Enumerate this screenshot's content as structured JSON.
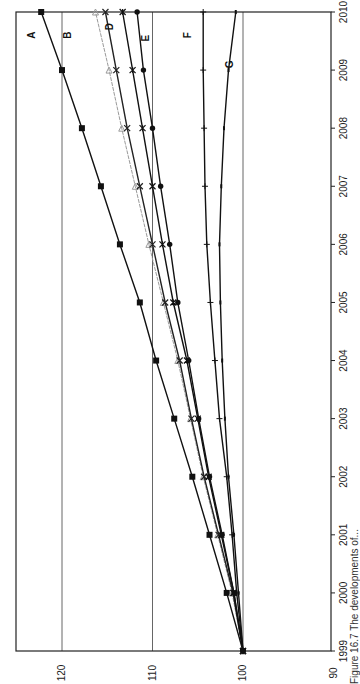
{
  "chart_data": {
    "type": "line",
    "orientation": "rotated-90-ccw",
    "title": "",
    "xlabel": "",
    "ylabel": "",
    "x": [
      "1999",
      "2000",
      "2001",
      "2002",
      "2003",
      "2004",
      "2005",
      "2006",
      "2007",
      "2008",
      "2009",
      "2010"
    ],
    "ylim": [
      90,
      125
    ],
    "yticks": [
      90,
      100,
      110,
      120
    ],
    "ytick_labels": [
      "90",
      "100",
      "110",
      "120"
    ],
    "grid": "horizontal gridlines at 100, 110, 120",
    "legend": "inline labels at line ends",
    "series": [
      {
        "name": "A",
        "marker": "square",
        "color": "#111111",
        "values": [
          100,
          101.8,
          103.7,
          105.6,
          107.6,
          109.6,
          111.4,
          113.6,
          115.7,
          117.8,
          120.0,
          122.3
        ]
      },
      {
        "name": "B",
        "marker": "triangle",
        "color": "#9a9a9a",
        "values": [
          100,
          101.2,
          102.8,
          104.4,
          105.8,
          107.2,
          108.8,
          110.4,
          111.9,
          113.4,
          114.8,
          116.3
        ]
      },
      {
        "name": "C",
        "marker": "x",
        "color": "#222222",
        "values": [
          100,
          101.1,
          102.7,
          104.3,
          105.7,
          107.0,
          108.6,
          110.0,
          111.4,
          112.8,
          114.0,
          115.2
        ]
      },
      {
        "name": "D",
        "marker": "asterisk",
        "color": "#111111",
        "values": [
          100,
          101.0,
          102.4,
          103.8,
          105.0,
          106.2,
          107.7,
          108.9,
          110.0,
          111.1,
          112.2,
          113.3
        ]
      },
      {
        "name": "E",
        "marker": "circle",
        "color": "#111111",
        "values": [
          100,
          101.0,
          102.3,
          103.7,
          104.9,
          106.0,
          107.2,
          108.1,
          109.1,
          110.0,
          111.0,
          111.7
        ]
      },
      {
        "name": "F",
        "marker": "plus",
        "color": "#111111",
        "values": [
          100,
          100.7,
          101.2,
          101.8,
          102.6,
          103.1,
          103.6,
          104.0,
          104.2,
          104.3,
          104.4,
          104.4
        ]
      },
      {
        "name": "G",
        "marker": "dash",
        "color": "#111111",
        "values": [
          100,
          100.5,
          101.0,
          101.6,
          102.0,
          102.3,
          102.5,
          102.6,
          102.4,
          102.1,
          101.6,
          100.8
        ]
      }
    ],
    "annotations": [
      {
        "text": "A",
        "year_pos": 2009.6,
        "value": 123.4
      },
      {
        "text": "B",
        "year_pos": 2009.6,
        "value": 119.4
      },
      {
        "text": "D",
        "year_pos": 2009.75,
        "value": 114.8
      },
      {
        "text": "E",
        "year_pos": 2009.55,
        "value": 110.8
      },
      {
        "text": "F",
        "year_pos": 2009.6,
        "value": 106.2
      },
      {
        "text": "G",
        "year_pos": 2009.1,
        "value": 101.6
      }
    ]
  },
  "caption": "Figure 16.7  The developments of..."
}
